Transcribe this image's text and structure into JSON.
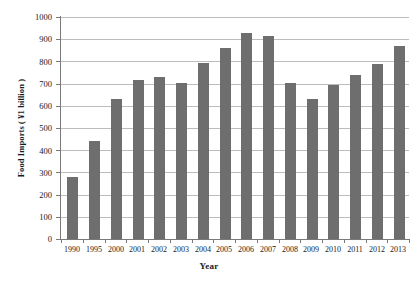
{
  "chart_data": {
    "type": "bar",
    "title": "",
    "subtitle": "",
    "xlabel": "Year",
    "ylabel": "Food Imports ( ¥1 billion )",
    "categories": [
      "1990",
      "1995",
      "2000",
      "2001",
      "2002",
      "2003",
      "2004",
      "2005",
      "2006",
      "2007",
      "2008",
      "2009",
      "2010",
      "2011",
      "2012",
      "2013"
    ],
    "values": [
      278,
      440,
      630,
      718,
      730,
      705,
      795,
      860,
      930,
      915,
      705,
      630,
      695,
      740,
      790,
      870
    ],
    "series": [
      {
        "name": "Food Imports",
        "values": [
          278,
          440,
          630,
          718,
          730,
          705,
          795,
          860,
          930,
          915,
          705,
          630,
          695,
          740,
          790,
          870
        ]
      }
    ],
    "ylim": [
      0,
      1000
    ],
    "ytick_labels": [
      "0",
      "100",
      "200",
      "300",
      "400",
      "500",
      "600",
      "700",
      "800",
      "900",
      "1000"
    ],
    "ytick_values": [
      0,
      100,
      200,
      300,
      400,
      500,
      600,
      700,
      800,
      900,
      1000
    ],
    "grid": "horizontal",
    "legend": "none",
    "bar_color": "#6e6e6e",
    "gridline_color": "#bcbcbc",
    "axis_color": "#7a7a7a",
    "background_color": "#ffffff"
  }
}
